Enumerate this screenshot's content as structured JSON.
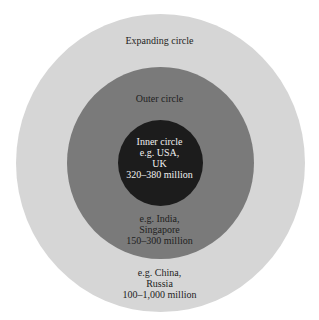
{
  "colors": {
    "expanding": "#d6d6d6",
    "outer": "#7a7a7a",
    "inner": "#1c1c1c"
  },
  "expanding_circle": {
    "title": "Expanding circle",
    "examples": [
      "e.g. China,",
      "Russia",
      "100–1,000 million"
    ]
  },
  "outer_circle": {
    "title": "Outer circle",
    "examples": [
      "e.g. India,",
      "Singapore",
      "150–300 million"
    ]
  },
  "inner_circle": {
    "lines": [
      "Inner circle",
      "e.g. USA,",
      "UK",
      "320–380 million"
    ]
  }
}
